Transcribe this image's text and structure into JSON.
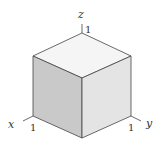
{
  "diagram": {
    "title": "",
    "type": "unit cube isometric view",
    "axes": [
      {
        "name": "x",
        "label": "x",
        "tick": "1"
      },
      {
        "name": "y",
        "label": "y",
        "tick": "1"
      },
      {
        "name": "z",
        "label": "z",
        "tick": "1"
      }
    ],
    "colors": {
      "left_face": "#c9c9c9",
      "right_face": "#e4e4e4",
      "top_face": "#f5f5f5",
      "edge": "#444444",
      "text": "#333333"
    }
  }
}
